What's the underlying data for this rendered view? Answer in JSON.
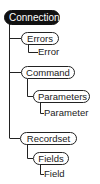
{
  "diagram": {
    "type": "object-hierarchy",
    "nodes": {
      "connection": "Connection",
      "errors": "Errors",
      "error": "Error",
      "command": "Command",
      "parameters": "Parameters",
      "parameter": "Parameter",
      "recordset": "Recordset",
      "fields": "Fields",
      "field": "Field"
    },
    "edges": [
      [
        "Connection",
        "Errors"
      ],
      [
        "Errors",
        "Error"
      ],
      [
        "Connection",
        "Command"
      ],
      [
        "Command",
        "Parameters"
      ],
      [
        "Parameters",
        "Parameter"
      ],
      [
        "Connection",
        "Recordset"
      ],
      [
        "Recordset",
        "Fields"
      ],
      [
        "Fields",
        "Field"
      ]
    ],
    "colors": {
      "root_fill": "#111111",
      "root_text": "#ffffff",
      "line": "#222222"
    }
  }
}
